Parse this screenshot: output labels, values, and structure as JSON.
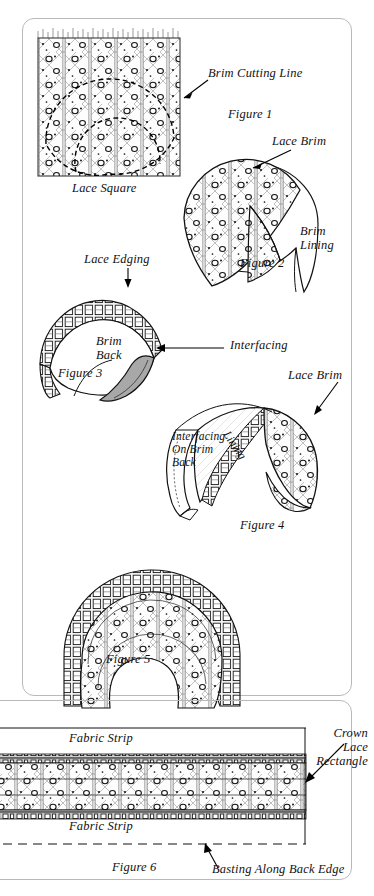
{
  "document": {
    "type": "sewing-instruction-illustration",
    "title": "Lace Bonnet Brim Construction",
    "ink_color": "#111111",
    "interfacing_fill": "#a8a8a8",
    "paper_color": "#ffffff"
  },
  "figures": [
    {
      "id": "figure-1",
      "caption": "Figure 1",
      "part_label": "Lace Square",
      "callouts": [
        {
          "text": "Brim Cutting Line"
        }
      ]
    },
    {
      "id": "figure-2",
      "caption": "Figure 2",
      "callouts": [
        {
          "text": "Lace Brim"
        },
        {
          "text": "Brim\nLining"
        }
      ]
    },
    {
      "id": "figure-3",
      "caption": "Figure 3",
      "callouts": [
        {
          "text": "Lace Edging"
        },
        {
          "text": "Brim\nBack"
        },
        {
          "text": "Interfacing"
        }
      ]
    },
    {
      "id": "figure-4",
      "caption": "Figure 4",
      "callouts": [
        {
          "text": "Lace Brim"
        },
        {
          "text": "Interfacing\nOn Brim\nBack"
        },
        {
          "text": "Lining"
        }
      ]
    },
    {
      "id": "figure-5",
      "caption": "Figure 5",
      "callouts": []
    },
    {
      "id": "figure-6",
      "caption": "Figure 6",
      "callouts": [
        {
          "text": "Fabric Strip"
        },
        {
          "text": "Fabric Strip"
        },
        {
          "text": "Crown\nLace\nRectangle"
        },
        {
          "text": "Basting Along Back Edge"
        }
      ]
    }
  ],
  "labels": {
    "brim_cutting_line": "Brim Cutting Line",
    "lace_square": "Lace Square",
    "figure_1": "Figure 1",
    "lace_brim_2": "Lace Brim",
    "brim_lining": "Brim\nLining",
    "figure_2": "Figure 2",
    "lace_edging": "Lace Edging",
    "brim_back": "Brim\nBack",
    "interfacing": "Interfacing",
    "figure_3": "Figure 3",
    "lace_brim_4": "Lace Brim",
    "interfacing_on_brim_back": "Interfacing\nOn Brim\nBack",
    "lining": "Lining",
    "figure_4": "Figure 4",
    "figure_5": "Figure 5",
    "fabric_strip_top": "Fabric Strip",
    "fabric_strip_bottom": "Fabric Strip",
    "crown_lace_rectangle": "Crown\nLace\nRectangle",
    "basting_along_back_edge": "Basting Along Back Edge",
    "figure_6": "Figure 6"
  }
}
